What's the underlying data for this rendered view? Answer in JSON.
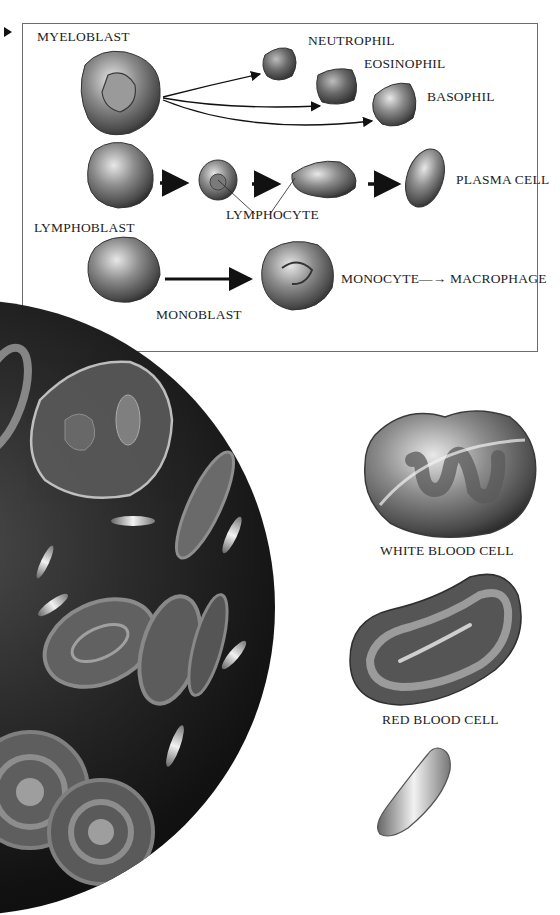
{
  "figure": {
    "pointer_icon": "triangle-pointer",
    "inset": {
      "labels": {
        "myeloblast": "MYELOBLAST",
        "neutrophil": "NEUTROPHIL",
        "eosinophil": "EOSINOPHIL",
        "basophil": "BASOPHIL",
        "lymphoblast": "LYMPHOBLAST",
        "lymphocyte": "LYMPHOCYTE",
        "plasma_cell": "PLASMA CELL",
        "monoblast": "MONOBLAST",
        "monocyte_macrophage": "MONOCYTE—→ MACROPHAGE"
      },
      "lineages": [
        {
          "from": "MYELOBLAST",
          "to": [
            "NEUTROPHIL",
            "EOSINOPHIL",
            "BASOPHIL"
          ]
        },
        {
          "from": "LYMPHOBLAST",
          "to": [
            "LYMPHOCYTE",
            "LYMPHOCYTE",
            "PLASMA CELL"
          ]
        },
        {
          "from": "MONOBLAST",
          "to": [
            "MONOCYTE",
            "MACROPHAGE"
          ]
        }
      ]
    },
    "side_labels": {
      "white_blood_cell": "WHITE BLOOD CELL",
      "red_blood_cell": "RED BLOOD CELL"
    },
    "colors": {
      "background": "#ffffff",
      "inset_border": "#6d6d6d",
      "text": "#1d1d1d",
      "micrograph_dark": "#0a0a0a"
    }
  }
}
